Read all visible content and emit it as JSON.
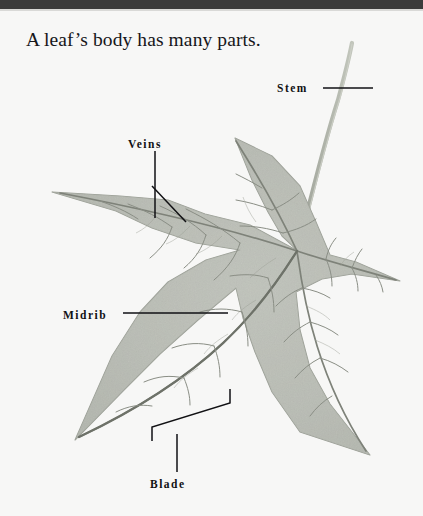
{
  "page": {
    "width": 423,
    "height": 516,
    "background_color": "#f7f7f6",
    "top_bar_color": "#3b3b3b"
  },
  "title": {
    "text": "A leaf’s body has many parts."
  },
  "labels": {
    "stem": "Stem",
    "veins": "Veins",
    "midrib": "Midrib",
    "blade": "Blade"
  },
  "diagram": {
    "leaf_fill_color": "#b9bcb4",
    "leaf_edge_color": "#9a9e95",
    "vein_color": "#7e8279",
    "stem_color": "#a9ada3",
    "leader_line_color": "#111114",
    "center_node": {
      "x": 298,
      "y": 251
    },
    "lobe_tips": [
      {
        "name": "upper-left-lobe-tip",
        "x": 52,
        "y": 192
      },
      {
        "name": "top-lobe-tip",
        "x": 235,
        "y": 138
      },
      {
        "name": "right-lobe-tip",
        "x": 400,
        "y": 281
      },
      {
        "name": "lower-left-lobe-tip",
        "x": 75,
        "y": 440
      },
      {
        "name": "lower-right-lobe-tip",
        "x": 370,
        "y": 455
      }
    ],
    "stem_path": "petiole curving up-right from center node to (352,42)"
  }
}
